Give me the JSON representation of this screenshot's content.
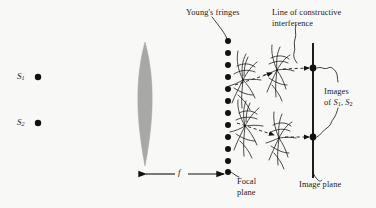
{
  "figure": {
    "type": "optics-ray-diagram",
    "title_present": false,
    "background_color": "#f8f8f6",
    "ink_color": "#111111",
    "lens_fill_color": "#a8a8a8"
  },
  "labels": {
    "source_1": "S",
    "source_1_sub": "1",
    "source_2": "S",
    "source_2_sub": "2",
    "focal_length": "f",
    "youngs_fringes": "Young's fringes",
    "line_of_constructive_1": "Line of constructive",
    "line_of_constructive_2": "interference",
    "images_of_1": "Images",
    "images_of_2_pre": "of ",
    "images_of_2_s1": "S",
    "images_of_2_s1_sub": "1",
    "images_of_2_comma": ", ",
    "images_of_2_s2": "S",
    "images_of_2_s2_sub": "2",
    "focal_plane_1": "Focal",
    "focal_plane_2": "plane",
    "image_plane": "Image plane"
  },
  "elements": {
    "sources": [
      {
        "name": "S1",
        "x": 38,
        "y": 77,
        "radius": 3.2
      },
      {
        "name": "S2",
        "x": 38,
        "y": 123,
        "radius": 3.2
      }
    ],
    "lens": {
      "center_x": 145,
      "top_y": 42,
      "bottom_y": 166,
      "half_width": 11
    },
    "focal_plane": {
      "x": 228,
      "dot_count": 12,
      "top_y": 41,
      "bottom_y": 172,
      "dot_radius": 3.0
    },
    "image_plane": {
      "x": 313,
      "top_y": 43,
      "bottom_y": 178
    },
    "image_points": [
      {
        "name": "image-of-S1",
        "x": 313,
        "y": 68,
        "radius": 3.4
      },
      {
        "name": "image-of-S2",
        "x": 313,
        "y": 137,
        "radius": 3.4
      }
    ],
    "focal_length_arrow": {
      "x_start": 140,
      "x_end": 228,
      "y": 174
    },
    "fringe_clusters": [
      {
        "name": "fringe-upper-near",
        "x": 243,
        "y": 80
      },
      {
        "name": "fringe-upper-far",
        "x": 277,
        "y": 70
      },
      {
        "name": "fringe-lower-near",
        "x": 245,
        "y": 126
      },
      {
        "name": "fringe-lower-far",
        "x": 279,
        "y": 138
      }
    ],
    "ray_arrows": [
      {
        "name": "ray-upper-1",
        "x1": 239,
        "y1": 84,
        "x2": 274,
        "y2": 73
      },
      {
        "name": "ray-upper-2",
        "x1": 281,
        "y1": 70,
        "x2": 310,
        "y2": 68
      },
      {
        "name": "ray-lower-1",
        "x1": 241,
        "y1": 124,
        "x2": 276,
        "y2": 135
      },
      {
        "name": "ray-lower-2",
        "x1": 283,
        "y1": 137,
        "x2": 310,
        "y2": 137
      }
    ]
  },
  "label_positions": {
    "source_1": {
      "x": 17,
      "y": 71
    },
    "source_2": {
      "x": 17,
      "y": 117
    },
    "focal_length": {
      "x": 180,
      "y": 167
    },
    "youngs_fringes": {
      "x": 186,
      "y": 8
    },
    "line_of_constructive": {
      "x": 272,
      "y": 8
    },
    "images_of": {
      "x": 325,
      "y": 88
    },
    "focal_plane": {
      "x": 236,
      "y": 178
    },
    "image_plane": {
      "x": 300,
      "y": 181
    }
  }
}
